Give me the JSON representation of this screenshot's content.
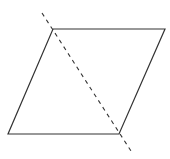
{
  "diagram": {
    "type": "geometry",
    "canvas": {
      "width": 170,
      "height": 159,
      "background": "#ffffff"
    },
    "parallelogram": {
      "vertices": [
        {
          "label": "",
          "x": 53,
          "y": 29
        },
        {
          "label": "",
          "x": 165,
          "y": 29
        },
        {
          "label": "",
          "x": 119,
          "y": 134
        },
        {
          "label": "",
          "x": 8,
          "y": 134
        }
      ],
      "stroke": "#333333",
      "stroke_width": 1.2
    },
    "diagonal": {
      "style": "dashed",
      "from": {
        "x": 42,
        "y": 13
      },
      "to": {
        "x": 131,
        "y": 151
      },
      "stroke": "#333333",
      "stroke_width": 1.1,
      "dash": "4,4"
    }
  }
}
